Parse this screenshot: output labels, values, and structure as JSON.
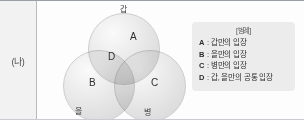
{
  "panel": {
    "row_label": "(나)"
  },
  "venn": {
    "regions": [
      {
        "letter": "A"
      },
      {
        "letter": "B"
      },
      {
        "letter": "C"
      },
      {
        "letter": "D"
      }
    ],
    "set_labels": {
      "top": "갑",
      "bottom_left": "을",
      "bottom_right": "병"
    }
  },
  "legend": {
    "title": "[범례]",
    "separator": ":",
    "entries": [
      {
        "key": "A",
        "text": "갑만의 입장"
      },
      {
        "key": "B",
        "text": "을만의 입장"
      },
      {
        "key": "C",
        "text": "병만의 입장"
      },
      {
        "key": "D",
        "text": "갑, 을만의 공통 입장"
      }
    ]
  },
  "colors": {
    "panel_background": "#f2f2f2",
    "legend_background": "#ececec",
    "circle_fill": "#e4e4e4",
    "border": "#b7bbbf",
    "text": "#2e2e2e"
  }
}
